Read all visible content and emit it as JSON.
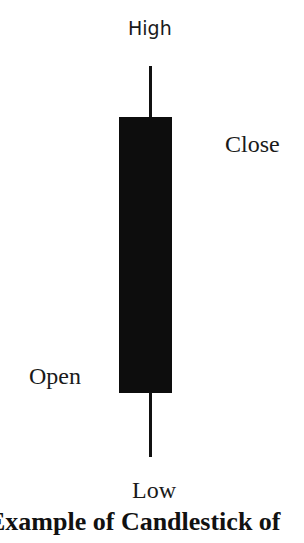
{
  "diagram": {
    "labels": {
      "high": "High",
      "close": "Close",
      "open": "Open",
      "low": "Low"
    },
    "caption": "Example of Candlestick of",
    "colors": {
      "body": "#0d0d0d",
      "wick": "#111111",
      "background": "#ffffff"
    }
  }
}
